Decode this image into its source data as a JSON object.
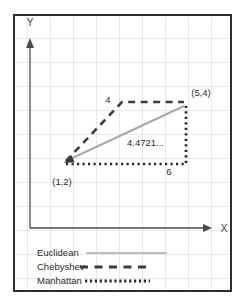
{
  "axes": {
    "x_label": "X",
    "y_label": "Y"
  },
  "points": {
    "a": {
      "label": "(1,2)",
      "x": 1,
      "y": 2
    },
    "b": {
      "label": "(5,4)",
      "x": 5,
      "y": 4
    }
  },
  "distances": {
    "euclidean": {
      "name": "Euclidean",
      "value": "4.4721..."
    },
    "chebyshev": {
      "name": "Chebyshev",
      "value": "4"
    },
    "manhattan": {
      "name": "Manhattan",
      "value": "6"
    }
  },
  "legend": {
    "items": [
      {
        "label": "Euclidean",
        "style": "solid"
      },
      {
        "label": "Chebyshev",
        "style": "dashed"
      },
      {
        "label": "Manhattan",
        "style": "dotted"
      }
    ]
  },
  "colors": {
    "border": "#2e2e2e",
    "axis": "#4a4a4a",
    "grid": "#e7e7ee",
    "euclidean": "#a9a9a9",
    "chebyshev": "#3c3c3c",
    "manhattan": "#262626",
    "text": "#2b2b2b"
  }
}
